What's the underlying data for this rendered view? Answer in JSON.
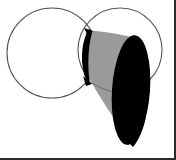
{
  "figure": {
    "background_color": "#ffffff",
    "outline_color": "#555555",
    "fill_black": "#000000",
    "fill_gray": "#9a9a9a",
    "gray_edge_color": "#6e6e6e",
    "frame_color": "#2b2b2b",
    "shapes": {
      "left_circle": {
        "name": "left-circle",
        "cx": 52,
        "cy": 53,
        "r": 45,
        "fill": "none",
        "stroke": "#555555",
        "stroke_width": 1
      },
      "right_circle": {
        "name": "right-circle",
        "cx": 120,
        "cy": 50,
        "r": 42,
        "fill": "none",
        "stroke": "#555555",
        "stroke_width": 1
      },
      "cone_body": {
        "name": "cone-body-gray",
        "fill": "#9a9a9a",
        "description": "slanted gray cone surface from upper lens to lower tip"
      },
      "cone_base_ellipse": {
        "name": "cone-base-black-ellipse",
        "fill": "#000000",
        "cx": 131,
        "cy": 90,
        "rx": 19,
        "ry": 55,
        "rotation_deg": 4,
        "description": "large black ellipse forming the oblique base of the cone"
      },
      "intersection_lens": {
        "name": "circle-intersection-lens-black",
        "fill": "#000000",
        "cx": 86,
        "cy": 56,
        "rx": 7,
        "ry": 27,
        "description": "narrow black lens at the overlap of the two circles"
      },
      "apex": {
        "name": "cone-apex-point",
        "x": 133,
        "y": 146
      }
    },
    "frame": {
      "right_border": true,
      "bottom_border": true,
      "top_border": false,
      "left_border": false,
      "color": "#2b2b2b",
      "thickness_px": 2
    }
  }
}
